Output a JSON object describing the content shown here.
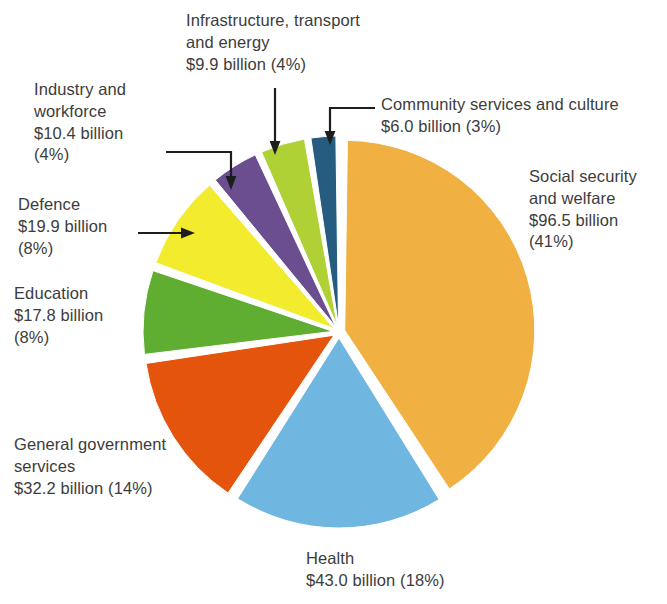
{
  "chart_data": {
    "type": "pie",
    "title": "",
    "units": "billion dollars",
    "total_label": "",
    "center": {
      "x": 339,
      "y": 332
    },
    "radius": 190,
    "explode": 6,
    "start_angle_deg": -90,
    "gap_deg": 1.6,
    "legend": "callout-labels",
    "grid": false,
    "categories": [
      "Social security and welfare",
      "Health",
      "General government services",
      "Education",
      "Defence",
      "Industry and workforce",
      "Infrastructure, transport and energy",
      "Community services and culture"
    ],
    "values": [
      96.5,
      43.0,
      32.2,
      17.8,
      19.9,
      10.4,
      9.9,
      6.0
    ],
    "percents": [
      41,
      18,
      14,
      8,
      8,
      4,
      4,
      3
    ],
    "colors": [
      "#F0B042",
      "#6FB7E0",
      "#E4540D",
      "#5FAE32",
      "#F2EB2E",
      "#6B4E8F",
      "#AFD136",
      "#255C80"
    ],
    "slices": [
      {
        "name": "Social security and welfare",
        "value": 96.5,
        "percent": 41,
        "color": "#F0B042"
      },
      {
        "name": "Health",
        "value": 43.0,
        "percent": 18,
        "color": "#6FB7E0"
      },
      {
        "name": "General government services",
        "value": 32.2,
        "percent": 14,
        "color": "#E4540D"
      },
      {
        "name": "Education",
        "value": 17.8,
        "percent": 8,
        "color": "#5FAE32"
      },
      {
        "name": "Defence",
        "value": 19.9,
        "percent": 8,
        "color": "#F2EB2E"
      },
      {
        "name": "Industry and workforce",
        "value": 10.4,
        "percent": 4,
        "color": "#6B4E8F"
      },
      {
        "name": "Infrastructure, transport and energy",
        "value": 9.9,
        "percent": 4,
        "color": "#AFD136"
      },
      {
        "name": "Community services and culture",
        "value": 6.0,
        "percent": 3,
        "color": "#255C80"
      }
    ]
  },
  "labels": {
    "infrastructure": "Infrastructure, transport\nand energy\n$9.9 billion (4%)",
    "industry": "Industry and\nworkforce\n$10.4 billion\n(4%)",
    "community": "Community services and culture\n$6.0 billion (3%)",
    "social": "Social security\nand welfare\n$96.5 billion\n(41%)",
    "defence": "Defence\n$19.9 billion\n(8%)",
    "education": "Education\n$17.8 billion\n(8%)",
    "general": "General government\nservices\n$32.2 billion (14%)",
    "health": "Health\n$43.0 billion (18%)"
  },
  "style": {
    "background": "#ffffff",
    "text_color": "#3c3c3c",
    "leader_color": "#1d1d1d",
    "slice_gap_color": "#ffffff"
  }
}
